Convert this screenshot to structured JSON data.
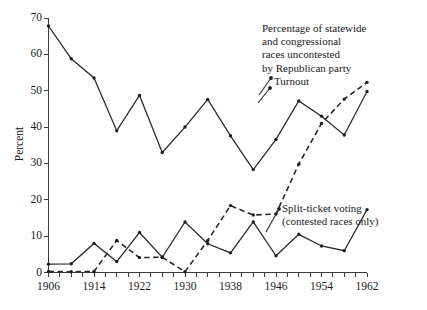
{
  "chart_data": {
    "type": "line",
    "title": "",
    "xlabel": "",
    "ylabel": "Percent",
    "xlim": [
      1906,
      1962
    ],
    "ylim": [
      0,
      70
    ],
    "grid": false,
    "legend_position": "inline-annotations",
    "x_tick_labels": [
      "1906",
      "1914",
      "1922",
      "1930",
      "1938",
      "1946",
      "1954",
      "1962"
    ],
    "x_tick_values": [
      1906,
      1914,
      1922,
      1930,
      1938,
      1946,
      1954,
      1962
    ],
    "x_minor_tick_interval": 2,
    "y_tick_labels": [
      "0",
      "10",
      "20",
      "30",
      "40",
      "50",
      "60",
      "70"
    ],
    "y_tick_values": [
      0,
      10,
      20,
      30,
      40,
      50,
      60,
      70
    ],
    "x": [
      1906,
      1910,
      1914,
      1918,
      1922,
      1926,
      1930,
      1934,
      1938,
      1942,
      1946,
      1950,
      1954,
      1958,
      1962
    ],
    "series": [
      {
        "name": "Turnout",
        "style": "solid",
        "values": [
          67.8,
          58.8,
          53.5,
          39.0,
          48.7,
          33.0,
          40.0,
          47.6,
          37.6,
          28.3,
          36.6,
          47.2,
          43.0,
          37.8,
          49.8
        ]
      },
      {
        "name": "Split-ticket voting (contested races only)",
        "style": "solid",
        "values": [
          2.3,
          2.4,
          8.0,
          3.0,
          11.0,
          4.2,
          13.9,
          7.9,
          5.4,
          13.9,
          4.6,
          10.5,
          7.3,
          6.0,
          17.3
        ]
      },
      {
        "name": "Percentage of statewide and congressional races uncontested by Republican party",
        "style": "dashed",
        "values": [
          0.3,
          0.2,
          0.3,
          8.8,
          4.1,
          4.2,
          0.2,
          8.8,
          18.4,
          15.8,
          16.1,
          29.8,
          41.0,
          47.7,
          52.3
        ]
      }
    ],
    "annotations": [
      {
        "name": "uncontested",
        "lines": [
          "Percentage of statewide",
          "and congressional",
          "races uncontested",
          "by Republican party"
        ]
      },
      {
        "name": "turnout",
        "lines": [
          "Turnout"
        ]
      },
      {
        "name": "split-ticket",
        "lines": [
          "Split-ticket voting",
          "(contested races only)"
        ]
      }
    ],
    "colors": {
      "line": "#2a2a2a",
      "axis": "#3b3b3b",
      "background": "#ffffff"
    }
  }
}
